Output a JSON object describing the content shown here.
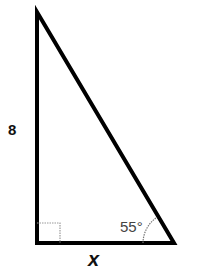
{
  "diagram": {
    "type": "right-triangle",
    "side_vertical_label": "8",
    "side_horizontal_label": "x",
    "angle_label": "55°",
    "right_angle_marker": true,
    "colors": {
      "stroke": "#000000",
      "marker": "#9a9a9a",
      "angle_text": "#444444"
    }
  }
}
